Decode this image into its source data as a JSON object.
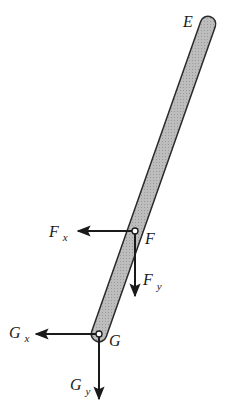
{
  "diagram": {
    "type": "free-body diagram",
    "colors": {
      "rod_fill": "#b5b5b5",
      "rod_stroke": "#2a2a2a",
      "arrow": "#1a1a1a",
      "background": "#ffffff"
    },
    "rod": {
      "top_end_label": "E",
      "top_center": [
        208,
        24
      ],
      "bottom_center": [
        99,
        334
      ],
      "width": 14
    },
    "points": {
      "F": {
        "label": "F",
        "x": 135,
        "y": 231
      },
      "G": {
        "label": "G",
        "x": 99,
        "y": 334
      }
    },
    "forces": [
      {
        "name": "Fx",
        "base": "F",
        "sub": "x",
        "direction": "left",
        "from": [
          135,
          231
        ],
        "to": [
          78,
          231
        ]
      },
      {
        "name": "Fy",
        "base": "F",
        "sub": "y",
        "direction": "down",
        "from": [
          135,
          231
        ],
        "to": [
          135,
          296
        ]
      },
      {
        "name": "Gx",
        "base": "G",
        "sub": "x",
        "direction": "left",
        "from": [
          99,
          334
        ],
        "to": [
          36,
          334
        ]
      },
      {
        "name": "Gy",
        "base": "G",
        "sub": "y",
        "direction": "down",
        "from": [
          99,
          334
        ],
        "to": [
          99,
          399
        ]
      }
    ],
    "labels": {
      "E": "E",
      "F": "F",
      "G": "G",
      "Fx_base": "F",
      "Fx_sub": "x",
      "Fy_base": "F",
      "Fy_sub": "y",
      "Gx_base": "G",
      "Gx_sub": "x",
      "Gy_base": "G",
      "Gy_sub": "y"
    }
  }
}
